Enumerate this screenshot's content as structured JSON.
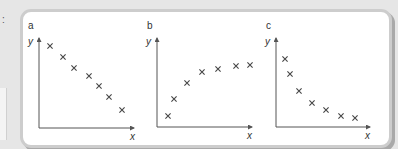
{
  "chart_data": [
    {
      "type": "scatter",
      "panel": "a",
      "xlabel": "x",
      "ylabel": "y",
      "grid": false,
      "description": "strong negative linear correlation",
      "points": [
        [
          1,
          9.0
        ],
        [
          2,
          7.9
        ],
        [
          3,
          6.8
        ],
        [
          4,
          6.0
        ],
        [
          5,
          5.0
        ],
        [
          6,
          3.9
        ],
        [
          7,
          2.6
        ]
      ],
      "px": [
        [
          50,
          46
        ],
        [
          63,
          57
        ],
        [
          74,
          68
        ],
        [
          89,
          76
        ],
        [
          99,
          86
        ],
        [
          109,
          97
        ],
        [
          122,
          110
        ]
      ],
      "axis": {
        "ox": 39,
        "oy": 128,
        "xend": 135,
        "ytop": 36
      }
    },
    {
      "type": "scatter",
      "panel": "b",
      "xlabel": "x",
      "ylabel": "y",
      "grid": false,
      "description": "positive non-linear (levelling off) correlation",
      "points": [
        [
          1,
          1.1
        ],
        [
          2,
          2.8
        ],
        [
          3,
          4.4
        ],
        [
          4,
          5.5
        ],
        [
          5,
          5.8
        ],
        [
          6,
          6.1
        ],
        [
          7,
          6.2
        ]
      ],
      "px": [
        [
          168,
          116
        ],
        [
          174,
          99
        ],
        [
          187,
          83
        ],
        [
          202,
          72
        ],
        [
          218,
          69
        ],
        [
          236,
          66
        ],
        [
          250,
          65
        ]
      ],
      "axis": {
        "ox": 157,
        "oy": 127,
        "xend": 255,
        "ytop": 36
      }
    },
    {
      "type": "scatter",
      "panel": "c",
      "xlabel": "x",
      "ylabel": "y",
      "grid": false,
      "description": "negative non-linear (decaying) correlation",
      "points": [
        [
          1,
          6.8
        ],
        [
          2,
          5.3
        ],
        [
          3,
          3.6
        ],
        [
          4,
          2.4
        ],
        [
          5,
          1.7
        ],
        [
          6,
          1.1
        ],
        [
          7,
          0.9
        ]
      ],
      "px": [
        [
          285,
          59
        ],
        [
          290,
          74
        ],
        [
          299,
          91
        ],
        [
          312,
          103
        ],
        [
          326,
          110
        ],
        [
          341,
          116
        ],
        [
          355,
          118
        ]
      ],
      "axis": {
        "ox": 276,
        "oy": 127,
        "xend": 368,
        "ytop": 36
      }
    }
  ],
  "labels": {
    "colon": ":",
    "a": {
      "panel": "a",
      "x": "x",
      "y": "y"
    },
    "b": {
      "panel": "b",
      "x": "x",
      "y": "y"
    },
    "c": {
      "panel": "c",
      "x": "x",
      "y": "y"
    }
  },
  "colors": {
    "frame": "#cdcdcd",
    "background": "#e6e6e6",
    "marker": "#444444"
  }
}
